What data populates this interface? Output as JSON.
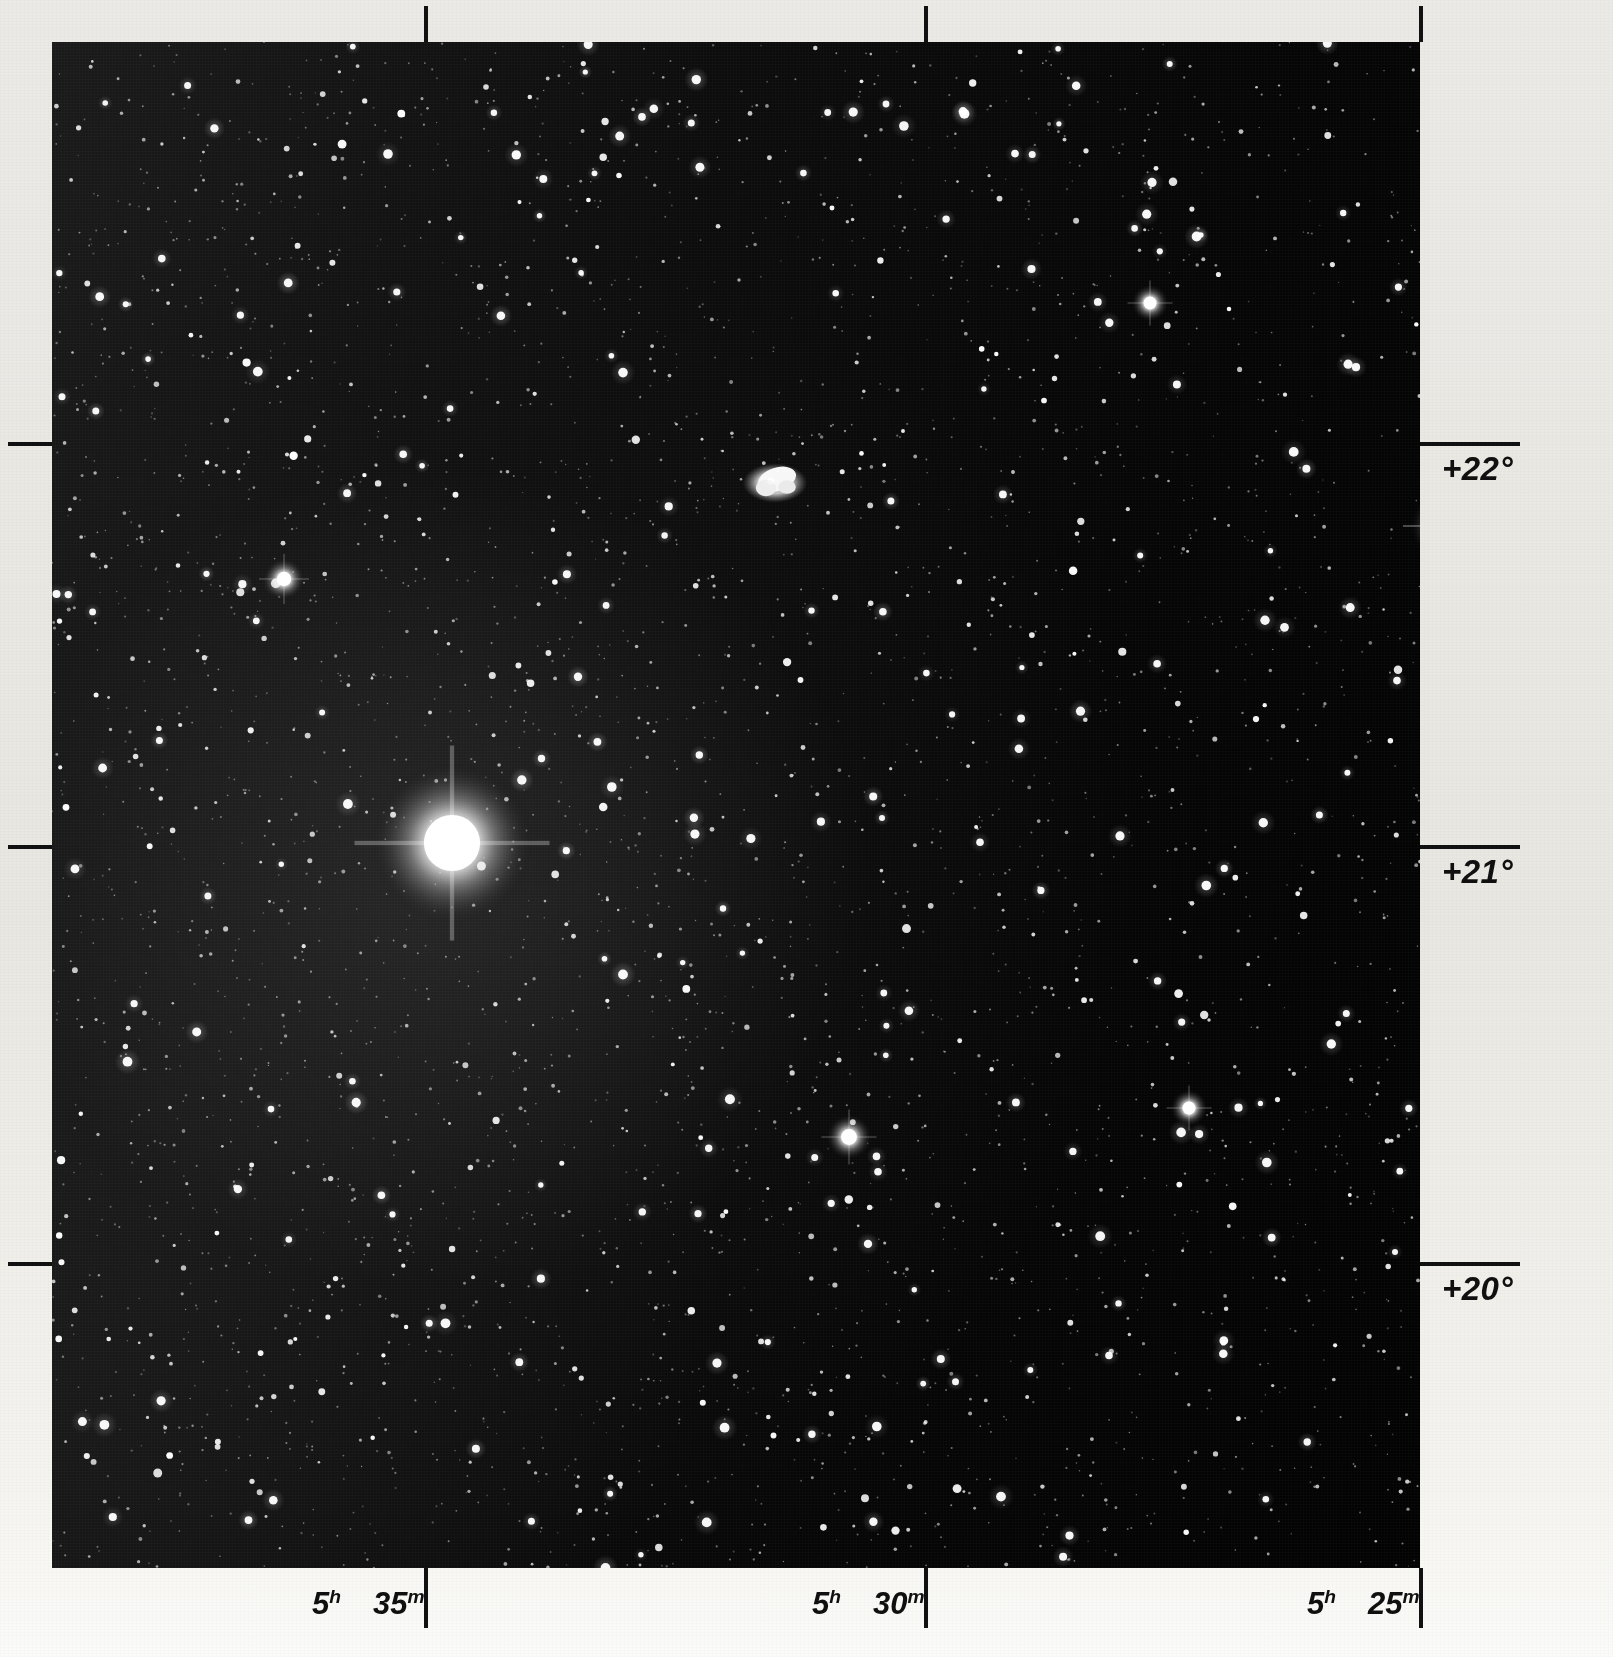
{
  "plate": {
    "title": "photographic sky survey plate",
    "background_color": "#050505",
    "paper_color": "#eceae4",
    "ink_color": "#101010"
  },
  "axes": {
    "declination": {
      "label_suffix": "°",
      "ticks": [
        {
          "name": "dec-22",
          "label": "+22°",
          "y": 442
        },
        {
          "name": "dec-21",
          "label": "+21°",
          "y": 845
        },
        {
          "name": "dec-20",
          "label": "+20°",
          "y": 1262
        }
      ]
    },
    "right_ascension": {
      "ticks": [
        {
          "name": "ra-5h35m",
          "hours": "5",
          "h_unit": "h",
          "minutes": "35",
          "m_unit": "m",
          "x": 372
        },
        {
          "name": "ra-5h30m",
          "hours": "5",
          "h_unit": "h",
          "minutes": "30",
          "m_unit": "m",
          "x": 872
        },
        {
          "name": "ra-5h25m",
          "hours": "5",
          "h_unit": "h",
          "minutes": "25",
          "m_unit": "m",
          "x": 1367
        }
      ]
    }
  },
  "objects": [
    {
      "name": "crab-nebula",
      "kind": "nebula",
      "x": 723,
      "y": 441,
      "size": 34
    },
    {
      "name": "bright-star-zeta-tauri",
      "kind": "bright-star",
      "x": 400,
      "y": 801,
      "size": 78
    },
    {
      "name": "bright-star-east-edge",
      "kind": "bright-star",
      "x": 1396,
      "y": 484,
      "size": 36
    },
    {
      "name": "bright-star-mid-lower",
      "kind": "bright-star",
      "x": 797,
      "y": 1095,
      "size": 22
    },
    {
      "name": "bright-star-west-upper",
      "kind": "bright-star",
      "x": 232,
      "y": 537,
      "size": 20
    },
    {
      "name": "bright-star-north-center",
      "kind": "bright-star",
      "x": 1098,
      "y": 261,
      "size": 18
    },
    {
      "name": "bright-star-east-lower",
      "kind": "bright-star",
      "x": 1137,
      "y": 1066,
      "size": 18
    }
  ],
  "chart_data": {
    "type": "scatter",
    "title": "",
    "xlabel": "Right Ascension",
    "ylabel": "Declination",
    "grid": false,
    "legend": "none",
    "x_ticklabels": [
      "5h 35m",
      "5h 30m",
      "5h 25m"
    ],
    "y_ticklabels": [
      "+22°",
      "+21°",
      "+20°"
    ],
    "xlim": [
      "5h 36m",
      "5h 24m"
    ],
    "ylim": [
      19.6,
      22.6
    ],
    "annotations": [
      {
        "text": "Crab Nebula (M1)",
        "x": "5h 32m",
        "y": 22.0
      },
      {
        "text": "bright saturated star",
        "x": "5h 34.7m",
        "y": 21.1
      }
    ]
  }
}
